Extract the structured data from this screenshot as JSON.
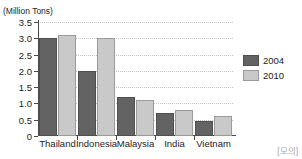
{
  "figure": {
    "unit_label": "(Million Tons)",
    "title_partial": "",
    "source_mark": "[모의]"
  },
  "legend": {
    "position": "right",
    "entries": [
      {
        "label": "2004",
        "color": "#636363"
      },
      {
        "label": "2010",
        "color": "#c9c9c9"
      }
    ]
  },
  "axis": {
    "y_ticks": [
      "0",
      "0.5",
      "1.0",
      "1.5",
      "2.0",
      "2.5",
      "3.0",
      "3.5"
    ],
    "y_tick_values": [
      0,
      0.5,
      1.0,
      1.5,
      2.0,
      2.5,
      3.0,
      3.5
    ]
  },
  "chart_data": {
    "type": "bar",
    "title": "",
    "subtitle": "",
    "xlabel": "",
    "ylabel": "(Million Tons)",
    "ylim": [
      0,
      3.5
    ],
    "grid": true,
    "legend_position": "right",
    "categories": [
      "Thailand",
      "Indonesia",
      "Malaysia",
      "India",
      "Vietnam"
    ],
    "series": [
      {
        "name": "2004",
        "color": "#636363",
        "values": [
          3.0,
          2.0,
          1.2,
          0.7,
          0.45
        ]
      },
      {
        "name": "2010",
        "color": "#c9c9c9",
        "values": [
          3.1,
          3.0,
          1.1,
          0.8,
          0.62
        ]
      }
    ]
  }
}
